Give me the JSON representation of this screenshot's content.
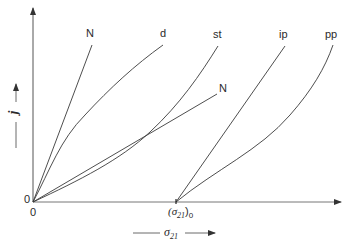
{
  "diagram": {
    "x_axis": {
      "symbol": "σ",
      "subscript": "21",
      "origin_label": "0",
      "threshold_label_open": "(σ",
      "threshold_subscript": "21",
      "threshold_label_close": ")",
      "threshold_sub_zero": "0"
    },
    "y_axis": {
      "symbol": "j",
      "origin_label": "0"
    },
    "curves": [
      {
        "label": "N",
        "type": "line",
        "start": "origin",
        "description": "steep straight line"
      },
      {
        "label": "d",
        "type": "curve",
        "start": "origin",
        "description": "concave-down curve"
      },
      {
        "label": "st",
        "type": "curve",
        "start": "origin",
        "description": "slightly concave curve"
      },
      {
        "label": "N",
        "type": "line",
        "start": "origin",
        "description": "shallow straight line"
      },
      {
        "label": "ip",
        "type": "line",
        "start": "(σ21)0",
        "description": "straight line from threshold"
      },
      {
        "label": "pp",
        "type": "curve",
        "start": "(σ21)0",
        "description": "concave-up curve from threshold"
      }
    ],
    "colors": {
      "line": "#3a3a3a",
      "axis": "#4a4a4a",
      "background": "#ffffff"
    }
  }
}
